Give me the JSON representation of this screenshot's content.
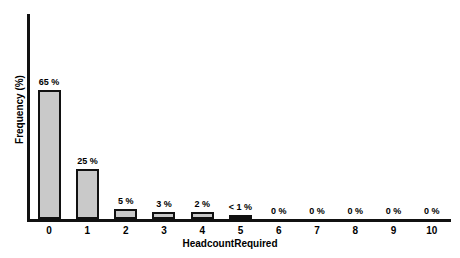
{
  "chart_data": {
    "type": "bar",
    "title": "",
    "subtitle": "",
    "xlabel": "HeadcountRequired",
    "ylabel": "Frequency (%)",
    "categories": [
      "0",
      "1",
      "2",
      "3",
      "4",
      "5",
      "6",
      "7",
      "8",
      "9",
      "10"
    ],
    "values": [
      65,
      25,
      5,
      3,
      2,
      0.5,
      0,
      0,
      0,
      0,
      0
    ],
    "data_labels": [
      "65 %",
      "25 %",
      "5 %",
      "3 %",
      "2 %",
      "< 1 %",
      "0 %",
      "0 %",
      "0 %",
      "0 %",
      "0 %"
    ],
    "ylim": [
      0,
      103
    ],
    "xlim_categories": 11,
    "grid": false,
    "legend": null,
    "colors": {
      "bar_fill": "#c9c9c9",
      "bar_border": "#111111",
      "tiny_bar_fill": "#111111",
      "axis": "#111111",
      "text": "#000000",
      "background": "#ffffff"
    }
  }
}
